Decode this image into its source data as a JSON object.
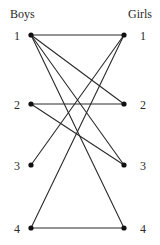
{
  "figure": {
    "title": "",
    "headings": {
      "left": "Boys",
      "right": "Girls"
    }
  },
  "chart_data": {
    "type": "diagram",
    "diagram_kind": "bipartite-graph",
    "title": "",
    "xlabel": "",
    "ylabel": "",
    "grid": false,
    "legend": "none",
    "partitions": [
      {
        "name": "Boys",
        "side": "left",
        "heading_x": 10,
        "heading_y": 18,
        "nodes": [
          {
            "id": "B1",
            "label": "1",
            "x": 31,
            "y": 35,
            "label_x": 14,
            "label_y": 40
          },
          {
            "id": "B2",
            "label": "2",
            "x": 31,
            "y": 104,
            "label_x": 14,
            "label_y": 109
          },
          {
            "id": "B3",
            "label": "3",
            "x": 31,
            "y": 165,
            "label_x": 14,
            "label_y": 170
          },
          {
            "id": "B4",
            "label": "4",
            "x": 31,
            "y": 228,
            "label_x": 14,
            "label_y": 233
          }
        ]
      },
      {
        "name": "Girls",
        "side": "right",
        "heading_x": 128,
        "heading_y": 18,
        "nodes": [
          {
            "id": "G1",
            "label": "1",
            "x": 124,
            "y": 35,
            "label_x": 140,
            "label_y": 40
          },
          {
            "id": "G2",
            "label": "2",
            "x": 124,
            "y": 104,
            "label_x": 140,
            "label_y": 109
          },
          {
            "id": "G3",
            "label": "3",
            "x": 124,
            "y": 165,
            "label_x": 140,
            "label_y": 170
          },
          {
            "id": "G4",
            "label": "4",
            "x": 124,
            "y": 228,
            "label_x": 140,
            "label_y": 233
          }
        ]
      }
    ],
    "edges": [
      {
        "from": "B1",
        "to": "G1",
        "x1": 31,
        "y1": 35,
        "x2": 124,
        "y2": 35
      },
      {
        "from": "B1",
        "to": "G2",
        "x1": 31,
        "y1": 35,
        "x2": 124,
        "y2": 104
      },
      {
        "from": "B1",
        "to": "G3",
        "x1": 31,
        "y1": 35,
        "x2": 124,
        "y2": 165
      },
      {
        "from": "B1",
        "to": "G4",
        "x1": 31,
        "y1": 35,
        "x2": 124,
        "y2": 228
      },
      {
        "from": "B2",
        "to": "G2",
        "x1": 31,
        "y1": 104,
        "x2": 124,
        "y2": 104
      },
      {
        "from": "B2",
        "to": "G3",
        "x1": 31,
        "y1": 104,
        "x2": 124,
        "y2": 165
      },
      {
        "from": "B3",
        "to": "G1",
        "x1": 31,
        "y1": 165,
        "x2": 124,
        "y2": 35
      },
      {
        "from": "B4",
        "to": "G1",
        "x1": 31,
        "y1": 228,
        "x2": 124,
        "y2": 35
      },
      {
        "from": "B4",
        "to": "G4",
        "x1": 31,
        "y1": 228,
        "x2": 124,
        "y2": 228
      }
    ],
    "edge_count": 9,
    "node_count": 8,
    "style": {
      "edge_color": "#2a2a2a",
      "node_color": "#111111",
      "text_color": "#2b2b2b",
      "background": "#ffffff",
      "node_radius": 2.6,
      "edge_width": 1.1
    }
  }
}
